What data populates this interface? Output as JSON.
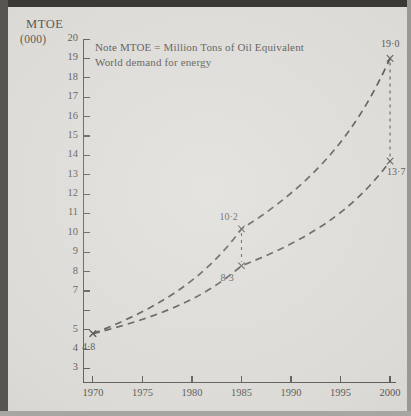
{
  "figure": {
    "y_axis_title_line1": "MTOE",
    "y_axis_title_line2": "(000)",
    "note_line1": "Note MTOE = Million Tons of Oil Equivalent",
    "note_line2": "World demand for energy"
  },
  "chart_data": {
    "type": "line",
    "title": "World demand for energy",
    "subtitle": "Note MTOE = Million Tons of Oil Equivalent",
    "xlabel": "",
    "ylabel": "MTOE (000)",
    "x": [
      1970,
      1985,
      2000
    ],
    "xlim": [
      1969,
      2000.6
    ],
    "ylim": [
      2.3,
      20
    ],
    "grid": false,
    "legend": "none",
    "xticks": [
      "1970",
      "1975",
      "1980",
      "1985",
      "1990",
      "1995",
      "2000"
    ],
    "xtick_values": [
      1970,
      1975,
      1980,
      1985,
      1990,
      1995,
      2000
    ],
    "yticks": [
      "20",
      "19",
      "18",
      "17",
      "16",
      "15",
      "14",
      "13",
      "12",
      "11",
      "10",
      "9",
      "8",
      "7",
      "",
      "5",
      "4",
      "3"
    ],
    "ytick_values": [
      20,
      19,
      18,
      17,
      16,
      15,
      14,
      13,
      12,
      11,
      10,
      9,
      8,
      7,
      6,
      5,
      4,
      3
    ],
    "series": [
      {
        "name": "upper-projection",
        "values": [
          4.8,
          10.2,
          19.0
        ],
        "style": "dashed",
        "marker": "x"
      },
      {
        "name": "lower-projection",
        "values": [
          4.8,
          8.3,
          13.7
        ],
        "style": "dashed",
        "marker": "x"
      }
    ],
    "annotations": [
      {
        "name": "origin-1970",
        "text": "4·8",
        "x": 1970,
        "y": 4.8
      },
      {
        "name": "upper-1985",
        "text": "10·2",
        "x": 1985,
        "y": 10.2
      },
      {
        "name": "lower-1985",
        "text": "8·3",
        "x": 1985,
        "y": 8.3
      },
      {
        "name": "upper-2000",
        "text": "19·0",
        "x": 2000,
        "y": 19.0
      },
      {
        "name": "lower-2000",
        "text": "13·7",
        "x": 2000,
        "y": 13.7
      }
    ],
    "connectors": [
      {
        "name": "gap-1985",
        "x": 1985,
        "y_top": 10.2,
        "y_bottom": 8.3
      },
      {
        "name": "gap-2000",
        "x": 2000,
        "y_top": 19.0,
        "y_bottom": 13.7
      }
    ],
    "colors": {
      "ink": "#4a4844",
      "paper": "#d8d6d1"
    }
  }
}
